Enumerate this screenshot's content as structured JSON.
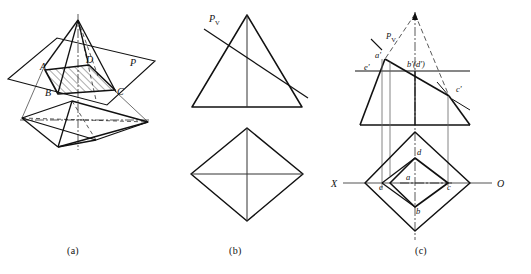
{
  "figure": {
    "panels": [
      {
        "id": "a",
        "caption": "(a)",
        "description": "Pictorial view: square pyramid intersected by oblique cutting plane P, section ABCD hatched",
        "labels": [
          {
            "name": "vertex-A",
            "text": "A",
            "x": 44,
            "y": 67
          },
          {
            "name": "vertex-D",
            "text": "D",
            "x": 88,
            "y": 62
          },
          {
            "name": "plane-P",
            "text": "P",
            "x": 130,
            "y": 63
          },
          {
            "name": "vertex-B",
            "text": "B",
            "x": 48,
            "y": 93
          },
          {
            "name": "vertex-C",
            "text": "C",
            "x": 116,
            "y": 92
          }
        ]
      },
      {
        "id": "b",
        "caption": "(b)",
        "description": "Orthographic projections of the whole pyramid with the cutting-plane trace Pv",
        "labels": [
          {
            "name": "plane-trace-pv",
            "text": "P",
            "sub": "V",
            "x": 212,
            "y": 18
          }
        ]
      },
      {
        "id": "c",
        "caption": "(c)",
        "description": "Solved projections: front view with section points a' e' b'(d') c' and top view a b c d e",
        "labels": [
          {
            "name": "plane-trace-pv",
            "text": "P",
            "sub": "V",
            "x": 389,
            "y": 36
          },
          {
            "name": "point-a-prime",
            "text": "a'",
            "x": 379,
            "y": 57
          },
          {
            "name": "point-e-prime",
            "text": "e'",
            "x": 367,
            "y": 69
          },
          {
            "name": "point-b-d-prime",
            "text": "b'(d')",
            "x": 411,
            "y": 65
          },
          {
            "name": "point-c-prime",
            "text": "c'",
            "x": 458,
            "y": 90
          },
          {
            "name": "axis-x",
            "text": "X",
            "x": 334,
            "y": 186
          },
          {
            "name": "axis-o",
            "text": "O",
            "x": 499,
            "y": 186
          },
          {
            "name": "point-d",
            "text": "d",
            "x": 419,
            "y": 155
          },
          {
            "name": "point-a",
            "text": "a",
            "x": 408,
            "y": 179
          },
          {
            "name": "point-e",
            "text": "e",
            "x": 383,
            "y": 188
          },
          {
            "name": "point-c",
            "text": "c",
            "x": 450,
            "y": 188
          },
          {
            "name": "point-b",
            "text": "b",
            "x": 418,
            "y": 211
          }
        ]
      }
    ],
    "captions": {
      "a": "(a)",
      "b": "(b)",
      "c": "(c)"
    },
    "colors": {
      "line": "#111111",
      "thin_line": "#333333",
      "background": "#ffffff"
    }
  }
}
